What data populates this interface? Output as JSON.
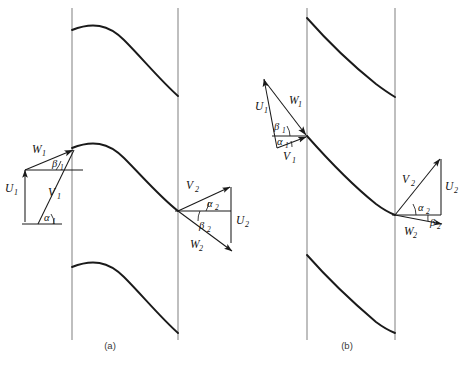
{
  "figure": {
    "background_color": "#ffffff",
    "line_color": "#1a1a1a",
    "pitch_line_color": "#8a8a8a",
    "width": 460,
    "height": 368
  },
  "panels": [
    {
      "id": "a",
      "caption": "(a)",
      "caption_x": 110,
      "caption_y": 349,
      "blade_count": 3,
      "inlet": {
        "W": "W",
        "W_sub": "1",
        "U": "U",
        "U_sub": "1",
        "V": "V",
        "V_sub": "1",
        "beta": "β",
        "beta_sub": "1",
        "alpha": "α",
        "alpha_sub": "1"
      },
      "outlet": {
        "V": "V",
        "V_sub": "2",
        "U": "U",
        "U_sub": "2",
        "W": "W",
        "W_sub": "2",
        "alpha": "α",
        "alpha_sub": "2",
        "beta": "β",
        "beta_sub": "2"
      }
    },
    {
      "id": "b",
      "caption": "(b)",
      "caption_x": 347,
      "caption_y": 349,
      "blade_count": 3,
      "inlet": {
        "U": "U",
        "U_sub": "1",
        "W": "W",
        "W_sub": "1",
        "V": "V",
        "V_sub": "1",
        "beta": "β",
        "beta_sub": "1",
        "alpha": "α",
        "alpha_sub": "1"
      },
      "outlet": {
        "V": "V",
        "V_sub": "2",
        "U": "U",
        "U_sub": "2",
        "W": "W",
        "W_sub": "2",
        "alpha": "α",
        "alpha_sub": "2",
        "beta": "β",
        "beta_sub": "2"
      }
    }
  ],
  "geometry": {
    "panel_a": {
      "pitch_lines": [
        {
          "x": 72,
          "y1": 8,
          "y2": 340
        },
        {
          "x": 178,
          "y1": 8,
          "y2": 340
        }
      ],
      "blades": [
        "M 72 30 C 92 22 108 24 124 40 C 142 58 160 80 178 96",
        "M 72 148 C 92 140 108 142 124 158 C 142 176 160 197 178 211",
        "M 72 267 C 92 259 108 261 124 277 C 142 295 160 317 178 333"
      ],
      "inlet_apex": {
        "x": 75,
        "y": 148
      },
      "inlet_u_tail": {
        "x": 25,
        "y": 220
      },
      "inlet_u_head": {
        "x": 25,
        "y": 170
      },
      "inlet_v_tail": {
        "x": 38,
        "y": 222
      },
      "outlet_origin": {
        "x": 178,
        "y": 211
      },
      "outlet_v_head": {
        "x": 231,
        "y": 186
      },
      "outlet_u_tail": {
        "x": 231,
        "y": 186
      },
      "outlet_u_head": {
        "x": 231,
        "y": 243
      },
      "outlet_w_head": {
        "x": 233,
        "y": 252
      }
    },
    "panel_b": {
      "pitch_lines": [
        {
          "x": 307,
          "y1": 8,
          "y2": 340
        },
        {
          "x": 395,
          "y1": 8,
          "y2": 340
        }
      ],
      "blades": [
        "M 307 18 C 330 44 356 68 376 84 C 384 90 390 94 395 97",
        "M 307 136 C 330 162 356 188 376 204 C 384 210 390 213 395 215",
        "M 307 255 C 330 281 356 305 376 322 C 384 328 390 331 395 333"
      ],
      "inlet_tip": {
        "x": 307,
        "y": 136
      },
      "inlet_u_tail": {
        "x": 277,
        "y": 148
      },
      "inlet_u_head": {
        "x": 263,
        "y": 78
      },
      "outlet_origin": {
        "x": 395,
        "y": 215
      },
      "outlet_v_head": {
        "x": 441,
        "y": 158
      },
      "outlet_u_head": {
        "x": 441,
        "y": 215
      },
      "outlet_w_head": {
        "x": 443,
        "y": 225
      }
    }
  }
}
